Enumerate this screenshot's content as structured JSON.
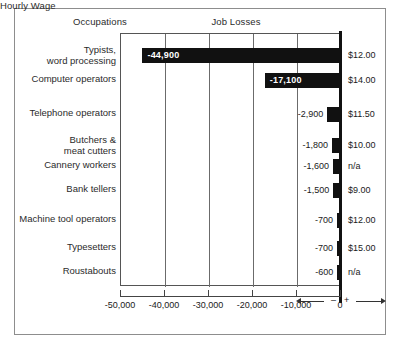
{
  "headers": {
    "occupations": "Occupations",
    "job_losses": "Job Losses",
    "hourly_wage": "Hourly Wage"
  },
  "axis": {
    "ticks": [
      "-50,000",
      "-40,000",
      "-30,000",
      "-20,000",
      "-10,000",
      "0"
    ],
    "minus_sign": "–",
    "plus_sign": "+"
  },
  "rows": [
    {
      "occupation": "Typists,\nword processing",
      "loss_label": "-44,900",
      "wage": "$12.00"
    },
    {
      "occupation": "Computer operators",
      "loss_label": "-17,100",
      "wage": "$14.00"
    },
    {
      "occupation": "Telephone operators",
      "loss_label": "-2,900",
      "wage": "$11.50"
    },
    {
      "occupation": "Butchers &\nmeat cutters",
      "loss_label": "-1,800",
      "wage": "$10.00"
    },
    {
      "occupation": "Cannery workers",
      "loss_label": "-1,600",
      "wage": "n/a"
    },
    {
      "occupation": "Bank tellers",
      "loss_label": "-1,500",
      "wage": "$9.00"
    },
    {
      "occupation": "Machine tool operators",
      "loss_label": "-700",
      "wage": "$12.00"
    },
    {
      "occupation": "Typesetters",
      "loss_label": "-700",
      "wage": "$15.00"
    },
    {
      "occupation": "Roustabouts",
      "loss_label": "-600",
      "wage": "n/a"
    }
  ],
  "chart_data": {
    "type": "bar",
    "orientation": "horizontal",
    "title": "Job Losses",
    "xlabel": "",
    "ylabel": "Occupations",
    "xlim": [
      -50000,
      0
    ],
    "grid": true,
    "legend": "none",
    "xticks": [
      -50000,
      -40000,
      -30000,
      -20000,
      -10000,
      0
    ],
    "xticklabels": [
      "-50,000",
      "-40,000",
      "-30,000",
      "-20,000",
      "-10,000",
      "0"
    ],
    "categories": [
      "Typists, word processing",
      "Computer operators",
      "Telephone operators",
      "Butchers & meat cutters",
      "Cannery workers",
      "Bank tellers",
      "Machine tool operators",
      "Typesetters",
      "Roustabouts"
    ],
    "values": [
      -44900,
      -17100,
      -2900,
      -1800,
      -1600,
      -1500,
      -700,
      -700,
      -600
    ],
    "annotations": [
      {
        "category": "Typists, word processing",
        "text": "-44,900",
        "wage": "$12.00"
      },
      {
        "category": "Computer operators",
        "text": "-17,100",
        "wage": "$14.00"
      },
      {
        "category": "Telephone operators",
        "text": "-2,900",
        "wage": "$11.50"
      },
      {
        "category": "Butchers & meat cutters",
        "text": "-1,800",
        "wage": "$10.00"
      },
      {
        "category": "Cannery workers",
        "text": "-1,600",
        "wage": "n/a"
      },
      {
        "category": "Bank tellers",
        "text": "-1,500",
        "wage": "$9.00"
      },
      {
        "category": "Machine tool operators",
        "text": "-700",
        "wage": "$12.00"
      },
      {
        "category": "Typesetters",
        "text": "-700",
        "wage": "$15.00"
      },
      {
        "category": "Roustabouts",
        "text": "-600",
        "wage": "n/a"
      }
    ],
    "secondary_column": {
      "header": "Hourly Wage",
      "values": [
        "$12.00",
        "$14.00",
        "$11.50",
        "$10.00",
        "n/a",
        "$9.00",
        "$12.00",
        "$15.00",
        "n/a"
      ]
    },
    "colors": {
      "bar": "#111111",
      "frame": "#8d8d8d",
      "grid": "#6b6b6b",
      "background": "#ffffff"
    }
  }
}
